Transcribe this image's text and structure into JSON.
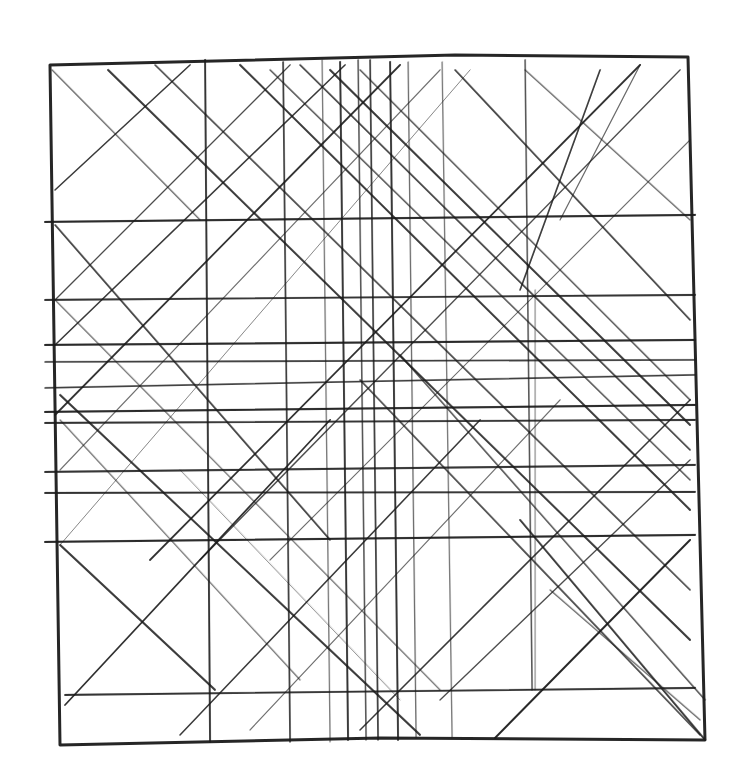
{
  "artwork": {
    "description": "hand-drawn pencil grid sketch",
    "ink_color": "#1a1a1a",
    "paper_color": "#ffffff",
    "frame": [
      [
        50,
        65
      ],
      [
        455,
        55
      ],
      [
        688,
        57
      ],
      [
        705,
        740
      ],
      [
        380,
        738
      ],
      [
        60,
        745
      ],
      [
        50,
        65
      ]
    ],
    "verticals": [
      {
        "x1": 205,
        "y1": 60,
        "x2": 210,
        "y2": 742,
        "w": 1.8,
        "o": 0.85
      },
      {
        "x1": 283,
        "y1": 62,
        "x2": 290,
        "y2": 742,
        "w": 1.6,
        "o": 0.8
      },
      {
        "x1": 322,
        "y1": 60,
        "x2": 330,
        "y2": 742,
        "w": 1.2,
        "o": 0.55
      },
      {
        "x1": 340,
        "y1": 62,
        "x2": 348,
        "y2": 740,
        "w": 1.8,
        "o": 0.85
      },
      {
        "x1": 358,
        "y1": 60,
        "x2": 366,
        "y2": 740,
        "w": 1.4,
        "o": 0.7
      },
      {
        "x1": 370,
        "y1": 60,
        "x2": 378,
        "y2": 740,
        "w": 1.6,
        "o": 0.8
      },
      {
        "x1": 390,
        "y1": 62,
        "x2": 398,
        "y2": 740,
        "w": 1.8,
        "o": 0.85
      },
      {
        "x1": 408,
        "y1": 62,
        "x2": 416,
        "y2": 738,
        "w": 1.2,
        "o": 0.6
      },
      {
        "x1": 442,
        "y1": 62,
        "x2": 452,
        "y2": 738,
        "w": 1.2,
        "o": 0.55
      },
      {
        "x1": 525,
        "y1": 60,
        "x2": 532,
        "y2": 690,
        "w": 1.4,
        "o": 0.7
      },
      {
        "x1": 535,
        "y1": 290,
        "x2": 535,
        "y2": 690,
        "w": 1.0,
        "o": 0.5
      }
    ],
    "horizontals": [
      {
        "x1": 45,
        "y1": 222,
        "x2": 695,
        "y2": 215,
        "w": 2.0,
        "o": 0.9
      },
      {
        "x1": 45,
        "y1": 300,
        "x2": 695,
        "y2": 295,
        "w": 1.8,
        "o": 0.85
      },
      {
        "x1": 45,
        "y1": 345,
        "x2": 695,
        "y2": 340,
        "w": 2.0,
        "o": 0.9
      },
      {
        "x1": 45,
        "y1": 362,
        "x2": 695,
        "y2": 360,
        "w": 1.6,
        "o": 0.8
      },
      {
        "x1": 45,
        "y1": 388,
        "x2": 695,
        "y2": 375,
        "w": 1.6,
        "o": 0.8
      },
      {
        "x1": 45,
        "y1": 412,
        "x2": 695,
        "y2": 405,
        "w": 2.0,
        "o": 0.9
      },
      {
        "x1": 45,
        "y1": 423,
        "x2": 695,
        "y2": 420,
        "w": 1.8,
        "o": 0.85
      },
      {
        "x1": 45,
        "y1": 472,
        "x2": 695,
        "y2": 465,
        "w": 1.8,
        "o": 0.85
      },
      {
        "x1": 45,
        "y1": 493,
        "x2": 695,
        "y2": 492,
        "w": 1.8,
        "o": 0.85
      },
      {
        "x1": 45,
        "y1": 542,
        "x2": 695,
        "y2": 535,
        "w": 2.0,
        "o": 0.9
      },
      {
        "x1": 65,
        "y1": 695,
        "x2": 695,
        "y2": 688,
        "w": 1.8,
        "o": 0.85
      }
    ],
    "diagonals_down": [
      {
        "x1": 52,
        "y1": 70,
        "x2": 200,
        "y2": 220,
        "w": 1.2,
        "o": 0.6
      },
      {
        "x1": 108,
        "y1": 70,
        "x2": 690,
        "y2": 640,
        "w": 1.8,
        "o": 0.85
      },
      {
        "x1": 155,
        "y1": 65,
        "x2": 690,
        "y2": 590,
        "w": 1.6,
        "o": 0.75
      },
      {
        "x1": 240,
        "y1": 65,
        "x2": 690,
        "y2": 510,
        "w": 1.8,
        "o": 0.85
      },
      {
        "x1": 270,
        "y1": 70,
        "x2": 690,
        "y2": 480,
        "w": 1.4,
        "o": 0.7
      },
      {
        "x1": 300,
        "y1": 65,
        "x2": 690,
        "y2": 450,
        "w": 1.6,
        "o": 0.8
      },
      {
        "x1": 330,
        "y1": 70,
        "x2": 690,
        "y2": 425,
        "w": 1.8,
        "o": 0.85
      },
      {
        "x1": 360,
        "y1": 70,
        "x2": 690,
        "y2": 400,
        "w": 1.4,
        "o": 0.7
      },
      {
        "x1": 455,
        "y1": 70,
        "x2": 690,
        "y2": 320,
        "w": 1.6,
        "o": 0.8
      },
      {
        "x1": 525,
        "y1": 70,
        "x2": 690,
        "y2": 220,
        "w": 1.2,
        "o": 0.6
      },
      {
        "x1": 55,
        "y1": 225,
        "x2": 330,
        "y2": 540,
        "w": 1.6,
        "o": 0.8
      },
      {
        "x1": 55,
        "y1": 300,
        "x2": 440,
        "y2": 690,
        "w": 1.2,
        "o": 0.55
      },
      {
        "x1": 60,
        "y1": 395,
        "x2": 420,
        "y2": 735,
        "w": 1.8,
        "o": 0.85
      },
      {
        "x1": 60,
        "y1": 420,
        "x2": 300,
        "y2": 680,
        "w": 1.2,
        "o": 0.55
      },
      {
        "x1": 60,
        "y1": 545,
        "x2": 215,
        "y2": 690,
        "w": 1.8,
        "o": 0.85
      },
      {
        "x1": 180,
        "y1": 470,
        "x2": 400,
        "y2": 700,
        "w": 1.0,
        "o": 0.45
      },
      {
        "x1": 360,
        "y1": 380,
        "x2": 700,
        "y2": 735,
        "w": 1.6,
        "o": 0.75
      },
      {
        "x1": 400,
        "y1": 355,
        "x2": 705,
        "y2": 700,
        "w": 1.4,
        "o": 0.7
      },
      {
        "x1": 520,
        "y1": 520,
        "x2": 705,
        "y2": 740,
        "w": 1.8,
        "o": 0.85
      },
      {
        "x1": 550,
        "y1": 590,
        "x2": 700,
        "y2": 720,
        "w": 1.2,
        "o": 0.6
      }
    ],
    "diagonals_up": [
      {
        "x1": 55,
        "y1": 190,
        "x2": 190,
        "y2": 65,
        "w": 1.6,
        "o": 0.8
      },
      {
        "x1": 55,
        "y1": 300,
        "x2": 290,
        "y2": 65,
        "w": 1.4,
        "o": 0.7
      },
      {
        "x1": 55,
        "y1": 345,
        "x2": 345,
        "y2": 65,
        "w": 1.6,
        "o": 0.8
      },
      {
        "x1": 55,
        "y1": 415,
        "x2": 400,
        "y2": 65,
        "w": 1.8,
        "o": 0.85
      },
      {
        "x1": 60,
        "y1": 470,
        "x2": 440,
        "y2": 70,
        "w": 1.2,
        "o": 0.55
      },
      {
        "x1": 60,
        "y1": 545,
        "x2": 470,
        "y2": 70,
        "w": 1.0,
        "o": 0.45
      },
      {
        "x1": 150,
        "y1": 560,
        "x2": 640,
        "y2": 65,
        "w": 1.8,
        "o": 0.85
      },
      {
        "x1": 200,
        "y1": 560,
        "x2": 680,
        "y2": 70,
        "w": 1.4,
        "o": 0.7
      },
      {
        "x1": 270,
        "y1": 560,
        "x2": 690,
        "y2": 140,
        "w": 1.2,
        "o": 0.55
      },
      {
        "x1": 65,
        "y1": 705,
        "x2": 330,
        "y2": 420,
        "w": 1.8,
        "o": 0.85
      },
      {
        "x1": 180,
        "y1": 735,
        "x2": 480,
        "y2": 420,
        "w": 1.6,
        "o": 0.8
      },
      {
        "x1": 250,
        "y1": 730,
        "x2": 560,
        "y2": 400,
        "w": 1.2,
        "o": 0.55
      },
      {
        "x1": 360,
        "y1": 730,
        "x2": 690,
        "y2": 400,
        "w": 1.6,
        "o": 0.8
      },
      {
        "x1": 495,
        "y1": 738,
        "x2": 690,
        "y2": 540,
        "w": 2.0,
        "o": 0.9
      },
      {
        "x1": 440,
        "y1": 700,
        "x2": 690,
        "y2": 460,
        "w": 1.4,
        "o": 0.7
      },
      {
        "x1": 520,
        "y1": 290,
        "x2": 600,
        "y2": 70,
        "w": 1.6,
        "o": 0.8
      },
      {
        "x1": 560,
        "y1": 220,
        "x2": 640,
        "y2": 65,
        "w": 1.2,
        "o": 0.6
      }
    ]
  }
}
